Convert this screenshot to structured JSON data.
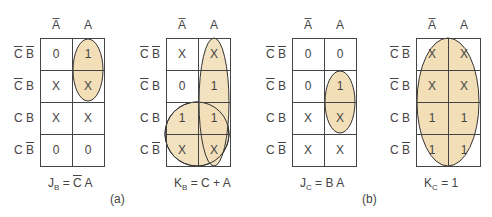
{
  "columns": [
    "A̅",
    "A"
  ],
  "rows": [
    {
      "c": "C",
      "c_bar": true,
      "b": "B",
      "b_bar": true
    },
    {
      "c": "C",
      "c_bar": true,
      "b": "B",
      "b_bar": false
    },
    {
      "c": "C",
      "c_bar": false,
      "b": "B",
      "b_bar": false
    },
    {
      "c": "C",
      "c_bar": false,
      "b": "B",
      "b_bar": true
    }
  ],
  "maps": [
    {
      "id": "JB",
      "cells": [
        [
          "0",
          "1"
        ],
        [
          "X",
          "X"
        ],
        [
          "X",
          "X"
        ],
        [
          "0",
          "0"
        ]
      ],
      "eq_lhs": "J",
      "eq_sub": "B",
      "eq_rhs_pre": " = ",
      "eq_rhs_bar": "C",
      "eq_rhs_post": " A"
    },
    {
      "id": "KB",
      "cells": [
        [
          "X",
          "X"
        ],
        [
          "0",
          "1"
        ],
        [
          "1",
          "1"
        ],
        [
          "X",
          "X"
        ]
      ],
      "eq_lhs": "K",
      "eq_sub": "B",
      "eq_rhs_pre": " = C + A",
      "eq_rhs_bar": "",
      "eq_rhs_post": ""
    },
    {
      "id": "JC",
      "cells": [
        [
          "0",
          "0"
        ],
        [
          "0",
          "1"
        ],
        [
          "X",
          "X"
        ],
        [
          "X",
          "X"
        ]
      ],
      "eq_lhs": "J",
      "eq_sub": "C",
      "eq_rhs_pre": " = B A",
      "eq_rhs_bar": "",
      "eq_rhs_post": ""
    },
    {
      "id": "KC",
      "cells": [
        [
          "X",
          "X"
        ],
        [
          "X",
          "X"
        ],
        [
          "1",
          "1"
        ],
        [
          "1",
          "1"
        ]
      ],
      "eq_lhs": "K",
      "eq_sub": "C",
      "eq_rhs_pre": " = 1",
      "eq_rhs_bar": "",
      "eq_rhs_post": ""
    }
  ],
  "part_labels": {
    "a": "(a)",
    "b": "(b)"
  },
  "colors": {
    "group_fill": "#f2dfb8",
    "group_stroke": "#333333",
    "grid": "#444444"
  }
}
